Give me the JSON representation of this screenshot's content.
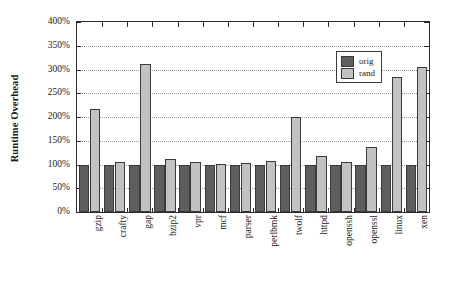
{
  "chart_data": {
    "type": "bar",
    "title": "",
    "subtitle": "",
    "xlabel": "",
    "ylabel": "Runtime Overhead",
    "ylim": [
      0,
      400
    ],
    "yunit": "%",
    "grid": true,
    "grid_style": "dotted horizontal",
    "legend_position": "top-right inside plot",
    "categories": [
      "gzip",
      "crafty",
      "gap",
      "bzip2",
      "vpr",
      "mcf",
      "parser",
      "perlbmk",
      "twolf",
      "httpd",
      "openssh",
      "openssl",
      "linux",
      "xen"
    ],
    "ytick_labels": [
      "0%",
      "50%",
      "100%",
      "150%",
      "200%",
      "250%",
      "300%",
      "350%",
      "400%"
    ],
    "ytick_values": [
      0,
      50,
      100,
      150,
      200,
      250,
      300,
      350,
      400
    ],
    "series": [
      {
        "name": "orig",
        "color": "#5e5e5e",
        "values": [
          100,
          100,
          100,
          99,
          100,
          100,
          100,
          100,
          100,
          99,
          99,
          99,
          99,
          99
        ]
      },
      {
        "name": "rand",
        "color": "#c2c2c2",
        "values": [
          216,
          105,
          312,
          111,
          106,
          101,
          104,
          108,
          200,
          117,
          105,
          137,
          285,
          306
        ]
      }
    ]
  },
  "legend": {
    "entries": [
      {
        "label": "orig",
        "color": "#5e5e5e"
      },
      {
        "label": "rand",
        "color": "#c2c2c2"
      }
    ]
  },
  "axes": {
    "y_title": "Runtime Overhead"
  }
}
